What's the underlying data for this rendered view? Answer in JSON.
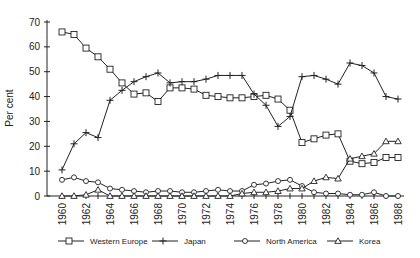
{
  "chart_data": {
    "type": "line",
    "title": "",
    "xlabel": "",
    "ylabel": "Per cent",
    "ylim": [
      0,
      70
    ],
    "yticks": [
      0,
      10,
      20,
      30,
      40,
      50,
      60,
      70
    ],
    "xlim": [
      1960,
      1988
    ],
    "xtick_labels": [
      "1960",
      "1962",
      "1964",
      "1966",
      "1968",
      "1970",
      "1972",
      "1974",
      "1976",
      "1978",
      "1980",
      "1982",
      "1984",
      "1986",
      "1988"
    ],
    "grid": false,
    "legend_position": "bottom",
    "x": [
      1960,
      1961,
      1962,
      1963,
      1964,
      1965,
      1966,
      1967,
      1968,
      1969,
      1970,
      1971,
      1972,
      1973,
      1974,
      1975,
      1976,
      1977,
      1978,
      1979,
      1980,
      1981,
      1982,
      1983,
      1984,
      1985,
      1986,
      1987,
      1988
    ],
    "series": [
      {
        "name": "Western Europe",
        "marker": "square",
        "values": [
          66,
          65,
          59.5,
          56,
          51,
          45.5,
          41,
          41.5,
          38,
          43.5,
          43.5,
          43,
          40.5,
          40,
          39.5,
          39.5,
          40,
          40.5,
          39,
          34.5,
          21.5,
          23,
          24.5,
          25,
          14,
          13,
          13.5,
          15.5,
          15.5
        ]
      },
      {
        "name": "Japan",
        "marker": "plus",
        "values": [
          10.5,
          21,
          25.5,
          23.5,
          38.5,
          42.5,
          46,
          48,
          49.5,
          45.5,
          46,
          46,
          47,
          48.5,
          48.5,
          48.5,
          41,
          36.5,
          28,
          32,
          48,
          48.5,
          47,
          45,
          53.5,
          52.5,
          49.5,
          40,
          39
        ]
      },
      {
        "name": "North America",
        "marker": "diamond",
        "values": [
          6.5,
          7.5,
          6,
          5.5,
          3,
          2.5,
          2,
          1.5,
          2,
          2,
          1.5,
          1.5,
          2,
          2.5,
          2,
          2,
          4.5,
          5,
          6,
          6.5,
          4,
          1.5,
          1,
          1,
          0.5,
          0.5,
          1.5,
          0,
          0
        ]
      },
      {
        "name": "Korea",
        "marker": "triangle",
        "values": [
          0,
          0,
          0.5,
          2.5,
          0,
          0,
          0,
          0,
          0,
          0,
          0,
          0,
          0,
          0,
          0,
          1,
          1.5,
          1.5,
          2,
          3,
          3,
          6,
          7.5,
          7,
          15,
          16,
          17,
          22,
          22
        ]
      }
    ]
  }
}
